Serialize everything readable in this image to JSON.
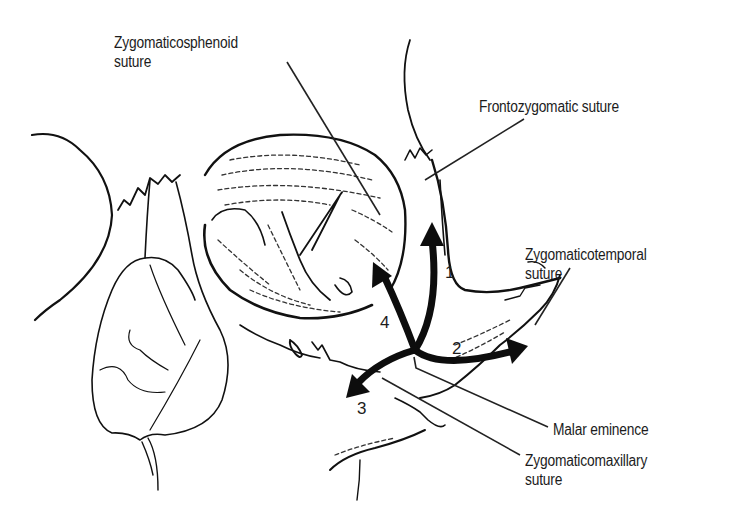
{
  "figure": {
    "labels": [
      {
        "id": "zygomaticosphenoid",
        "lines": [
          "Zygomaticosphenoid",
          "suture"
        ]
      },
      {
        "id": "frontozygomatic",
        "lines": [
          "Frontozygomatic suture"
        ]
      },
      {
        "id": "zygomaticotemporal",
        "lines": [
          "Zygomaticotemporal",
          "suture"
        ]
      },
      {
        "id": "malar",
        "lines": [
          "Malar eminence"
        ]
      },
      {
        "id": "zygomaticomaxillary",
        "lines": [
          "Zygomaticomaxillary",
          "suture"
        ]
      }
    ],
    "arrows": [
      {
        "number": "1",
        "direction": "up toward frontozygomatic suture"
      },
      {
        "number": "2",
        "direction": "right toward zygomaticotemporal suture"
      },
      {
        "number": "3",
        "direction": "down-left toward zygomaticomaxillary suture"
      },
      {
        "number": "4",
        "direction": "up-left toward zygomaticosphenoid suture"
      }
    ],
    "colors": {
      "ink": "#111111",
      "background": "#ffffff",
      "text": "#1c1c1c"
    }
  }
}
